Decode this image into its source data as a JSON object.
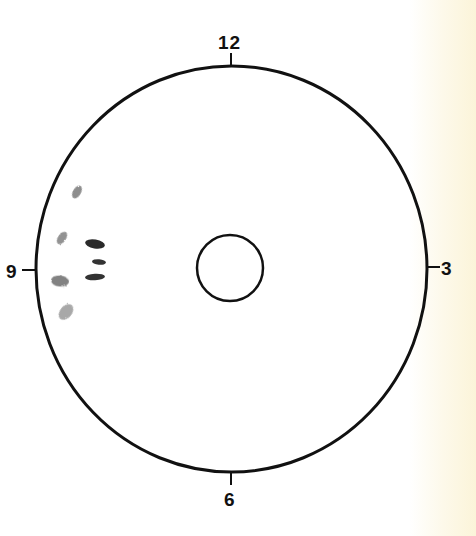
{
  "diagram": {
    "type": "shot-group-target",
    "clock_labels": {
      "top": "12",
      "right": "3",
      "bottom": "6",
      "left": "9"
    },
    "outer_ring": {
      "cx": 231.5,
      "cy": 269,
      "rx": 195.5,
      "ry": 203,
      "stroke": "#111111"
    },
    "center_ring": {
      "cx": 230,
      "cy": 268,
      "r": 33,
      "stroke": "#111111"
    },
    "marks": [
      {
        "id": "mark-1",
        "cx": 77,
        "cy": 192,
        "rx": 4,
        "ry": 7,
        "rotate": 30,
        "color": "#7a7a7a",
        "style": "smudge"
      },
      {
        "id": "mark-2",
        "cx": 62,
        "cy": 238,
        "rx": 4,
        "ry": 7,
        "rotate": 35,
        "color": "#808080",
        "style": "smudge"
      },
      {
        "id": "mark-3",
        "cx": 95,
        "cy": 244,
        "rx": 10,
        "ry": 4.5,
        "rotate": 10,
        "color": "#2a2a2a",
        "style": "solid"
      },
      {
        "id": "mark-4",
        "cx": 99,
        "cy": 262,
        "rx": 7,
        "ry": 2.8,
        "rotate": 5,
        "color": "#333333",
        "style": "solid"
      },
      {
        "id": "mark-5",
        "cx": 95,
        "cy": 277,
        "rx": 10,
        "ry": 3.2,
        "rotate": -3,
        "color": "#333333",
        "style": "solid"
      },
      {
        "id": "mark-6",
        "cx": 60,
        "cy": 281,
        "rx": 9,
        "ry": 5.5,
        "rotate": 5,
        "color": "#6d6d6d",
        "style": "smudge"
      },
      {
        "id": "mark-7",
        "cx": 66,
        "cy": 312,
        "rx": 6,
        "ry": 9,
        "rotate": 40,
        "color": "#9a9a9a",
        "style": "smudge"
      }
    ]
  }
}
